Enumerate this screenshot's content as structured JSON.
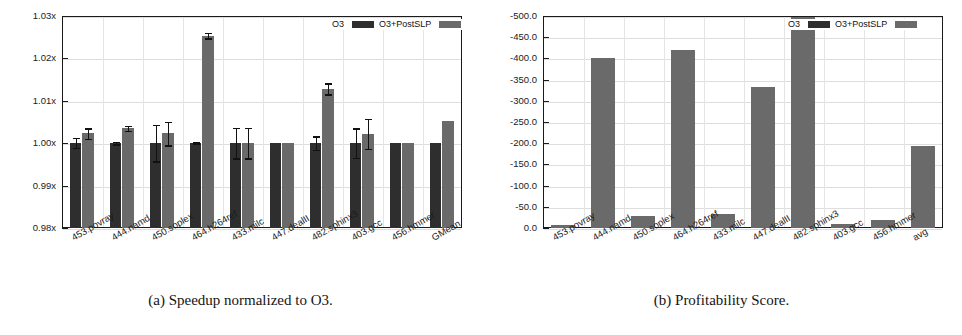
{
  "figure": {
    "panels": [
      {
        "id": "a",
        "caption": "(a) Speedup normalized to O3.",
        "legend": {
          "items": [
            "O3",
            "O3+PostSLP"
          ]
        }
      },
      {
        "id": "b",
        "caption": "(b) Profitability Score.",
        "legend": {
          "items": [
            "O3",
            "O3+PostSLP"
          ]
        }
      }
    ]
  },
  "colors": {
    "o3": "#2e2e2e",
    "postslp": "#6a6a6a",
    "axis": "#1a1a1a",
    "grid": "#dedede",
    "background": "#ffffff"
  },
  "chart_data": [
    {
      "type": "bar",
      "id": "speedup",
      "title": "(a) Speedup normalized to O3.",
      "xlabel": "",
      "ylabel": "",
      "ylim": [
        0.98,
        1.03
      ],
      "yticks": [
        0.98,
        0.99,
        1.0,
        1.01,
        1.02,
        1.03
      ],
      "ytick_labels": [
        "0.98x",
        "0.99x",
        "1.00x",
        "1.01x",
        "1.02x",
        "1.03x"
      ],
      "grid": true,
      "legend_position": "top-right",
      "categories": [
        "453.povray",
        "444.namd",
        "450.soplex",
        "464.h264ref",
        "433.milc",
        "447.dealII",
        "482.sphinx3",
        "403.gcc",
        "456.hmmer",
        "GMean"
      ],
      "series": [
        {
          "name": "O3",
          "values": [
            1.0,
            1.0,
            1.0,
            1.0,
            1.0,
            1.0,
            1.0,
            1.0,
            1.0,
            1.0
          ],
          "errors": [
            0.0012,
            0.0003,
            0.0043,
            0.0002,
            0.0036,
            0.0,
            0.0016,
            0.0035,
            0.0,
            0.0
          ]
        },
        {
          "name": "O3+PostSLP",
          "values": [
            1.0023,
            1.0035,
            1.0023,
            1.0254,
            1.0,
            1.0,
            1.0128,
            1.0022,
            1.0,
            1.0052
          ],
          "errors": [
            0.0012,
            0.0006,
            0.0028,
            0.0007,
            0.0036,
            0.0,
            0.0013,
            0.0035,
            0.0,
            0.0
          ]
        }
      ]
    },
    {
      "type": "bar",
      "id": "profitability",
      "title": "(b) Profitability Score.",
      "xlabel": "",
      "ylabel": "",
      "ylim": [
        -500.0,
        0.0
      ],
      "y_axis_inverted": true,
      "yticks": [
        0.0,
        -50.0,
        -100.0,
        -150.0,
        -200.0,
        -250.0,
        -300.0,
        -350.0,
        -400.0,
        -450.0,
        -500.0
      ],
      "ytick_labels": [
        "0.0",
        "-50.0",
        "-100.0",
        "-150.0",
        "-200.0",
        "-250.0",
        "-300.0",
        "-350.0",
        "-400.0",
        "-450.0",
        "-500.0"
      ],
      "grid": true,
      "legend_position": "top-right",
      "categories": [
        "453.povray",
        "444.namd",
        "450.soplex",
        "464.h264ref",
        "433.milc",
        "447.dealII",
        "482.sphinx3",
        "403.gcc",
        "456.hmmer",
        "avg"
      ],
      "series": [
        {
          "name": "O3+PostSLP",
          "values": [
            -8,
            -400,
            -28,
            -420,
            -33,
            -332,
            -498,
            -10,
            -20,
            -193
          ]
        }
      ]
    }
  ]
}
